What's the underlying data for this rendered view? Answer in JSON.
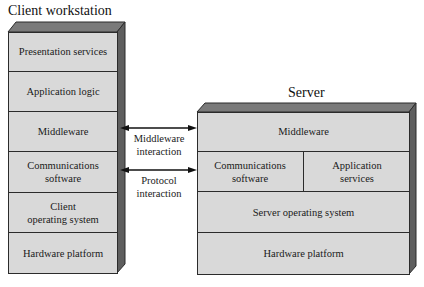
{
  "client": {
    "title": "Client workstation",
    "layers": [
      {
        "line1": "Presentation services",
        "line2": ""
      },
      {
        "line1": "Application logic",
        "line2": ""
      },
      {
        "line1": "Middleware",
        "line2": ""
      },
      {
        "line1": "Communications",
        "line2": "software"
      },
      {
        "line1": "Client",
        "line2": "operating system"
      },
      {
        "line1": "Hardware platform",
        "line2": ""
      }
    ]
  },
  "server": {
    "title": "Server",
    "layers": {
      "middleware": "Middleware",
      "comm_line1": "Communications",
      "comm_line2": "software",
      "app_line1": "Application",
      "app_line2": "services",
      "os": "Server operating system",
      "hardware": "Hardware platform"
    }
  },
  "connections": [
    {
      "line1": "Middleware",
      "line2": "interaction"
    },
    {
      "line1": "Protocol",
      "line2": "interaction"
    }
  ],
  "colors": {
    "face": "#d9d9d9",
    "top_bevel": "#7a7a7a",
    "side_bevel": "#5e5e5e",
    "line": "#2b2b2b"
  }
}
